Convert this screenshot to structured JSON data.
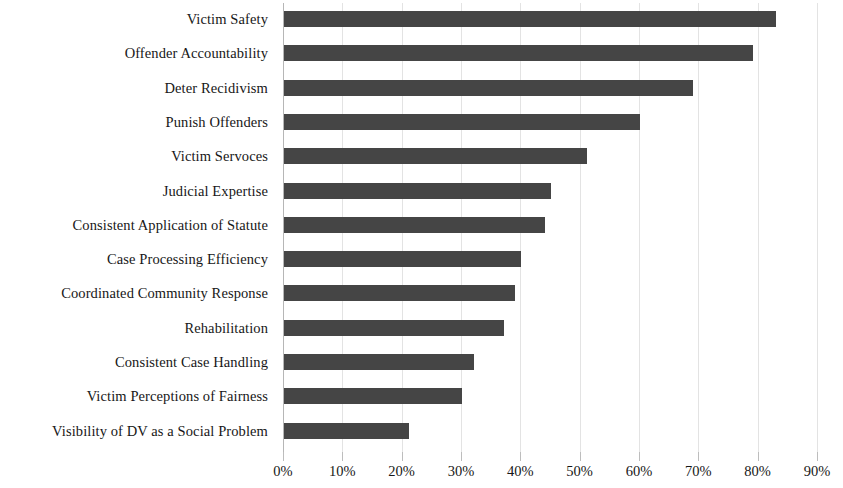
{
  "chart_data": {
    "type": "bar",
    "orientation": "horizontal",
    "title": "",
    "subtitle": "",
    "xlabel": "",
    "ylabel": "",
    "categories": [
      "Victim Safety",
      "Offender Accountability",
      "Deter Recidivism",
      "Punish Offenders",
      "Victim Servoces",
      "Judicial Expertise",
      "Consistent Application of Statute",
      "Case Processing Efficiency",
      "Coordinated Community Response",
      "Rehabilitation",
      "Consistent Case Handling",
      "Victim Perceptions of Fairness",
      "Visibility of DV as a Social Problem"
    ],
    "values": [
      83,
      79,
      69,
      60,
      51,
      45,
      44,
      40,
      39,
      37,
      32,
      30,
      21
    ],
    "value_unit": "%",
    "xlim": [
      0,
      90
    ],
    "xticks": [
      0,
      10,
      20,
      30,
      40,
      50,
      60,
      70,
      80,
      90
    ],
    "xtick_labels": [
      "0%",
      "10%",
      "20%",
      "30%",
      "40%",
      "50%",
      "60%",
      "70%",
      "80%",
      "90%"
    ],
    "grid": true,
    "grid_axis": "x",
    "legend": false,
    "series": [
      {
        "name": "",
        "color": "#454545",
        "values": [
          83,
          79,
          69,
          60,
          51,
          45,
          44,
          40,
          39,
          37,
          32,
          30,
          21
        ]
      }
    ]
  },
  "colors": {
    "bar": "#454545",
    "gridline": "#e3e3e3",
    "axis": "#b6b6b6",
    "text": "#171717",
    "background": "#ffffff"
  }
}
